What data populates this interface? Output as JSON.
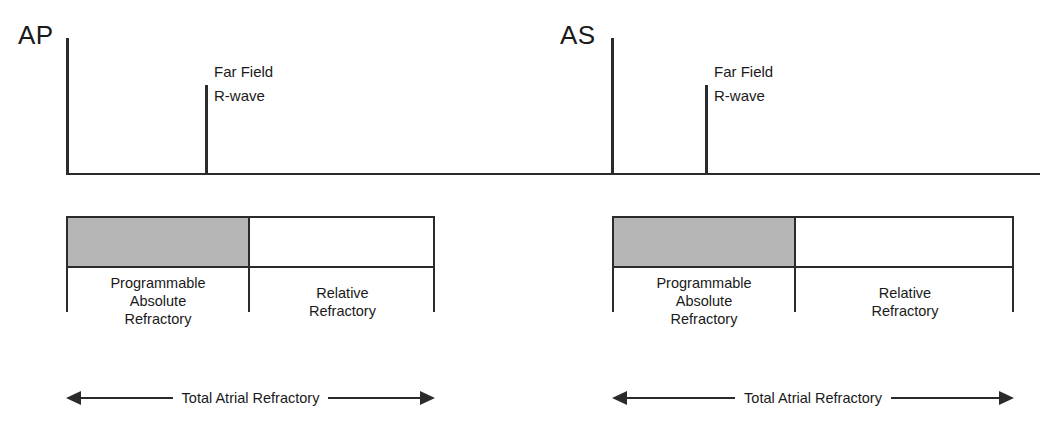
{
  "diagram": {
    "baseline_color": "#2b2b2b",
    "shaded_color": "#b6b6b6"
  },
  "cycles": [
    {
      "event_label": "AP",
      "far_field_label_line1": "Far Field",
      "far_field_label_line2": "R-wave",
      "absolute_caption_line1": "Programmable",
      "absolute_caption_line2": "Absolute",
      "absolute_caption_line3": "Refractory",
      "relative_caption_line1": "Relative",
      "relative_caption_line2": "Refractory",
      "total_label": "Total Atrial Refractory"
    },
    {
      "event_label": "AS",
      "far_field_label_line1": "Far Field",
      "far_field_label_line2": "R-wave",
      "absolute_caption_line1": "Programmable",
      "absolute_caption_line2": "Absolute",
      "absolute_caption_line3": "Refractory",
      "relative_caption_line1": "Relative",
      "relative_caption_line2": "Refractory",
      "total_label": "Total Atrial Refractory"
    }
  ]
}
